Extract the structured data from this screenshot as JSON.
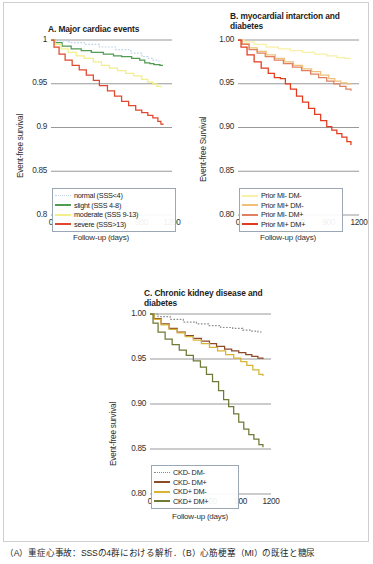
{
  "figure": {
    "caption": "（A）重症心事故：SSSの4群における解析．（B）心筋梗塞（MI）の既往と糖尿"
  },
  "shared": {
    "xlabel": "Follow-up (days)",
    "ylabel": "Event-free survival",
    "xticks": [
      "0",
      "300",
      "600",
      "900",
      "1200"
    ],
    "xlim": [
      0,
      1200
    ]
  },
  "colors": {
    "normal": "#bcd3e8",
    "slight": "#4f9c52",
    "moderate": "#f2ee8a",
    "severe": "#e0472c",
    "mi_neg_dm_neg": "#f7f0a8",
    "mi_pos_dm_neg": "#f0c07a",
    "mi_neg_dm_pos": "#e08060",
    "mi_pos_dm_pos": "#e33a1c",
    "ckd_neg_dm_neg": "#8a8a8a",
    "ckd_neg_dm_pos": "#8c4a2b",
    "ckd_pos_dm_neg": "#d8b434",
    "ckd_pos_dm_pos": "#6e7a35",
    "gridline": "#8d8d8d",
    "legend_border": "#9aa7b5"
  },
  "chart_data": [
    {
      "id": "panel-a",
      "type": "line",
      "title": "A. Major cardiac events",
      "xlabel": "Follow-up (days)",
      "ylabel": "Event-free survival",
      "xlim": [
        0,
        1200
      ],
      "ylim": [
        0.8,
        1.0
      ],
      "xticks": [
        "0",
        "300",
        "600",
        "900",
        "1200"
      ],
      "yticks": [
        "1",
        "0.95",
        "0.9",
        "0.85",
        "0.8"
      ],
      "ytick_values": [
        1.0,
        0.95,
        0.9,
        0.85,
        0.8
      ],
      "grid": "horizontal",
      "legend_position": "bottom-left",
      "series": [
        {
          "name": "normal  (SSS<4)",
          "key": "normal",
          "style": "dotted",
          "color": "#bcd3e8",
          "x": [
            0,
            60,
            180,
            330,
            480,
            640,
            790,
            900,
            960,
            1010,
            1060,
            1100
          ],
          "y": [
            1.0,
            0.999,
            0.997,
            0.995,
            0.992,
            0.989,
            0.985,
            0.981,
            0.979,
            0.977,
            0.976,
            0.976
          ]
        },
        {
          "name": "slight  (SSS 4-8)",
          "key": "slight",
          "style": "solid",
          "color": "#4f9c52",
          "x": [
            0,
            40,
            110,
            200,
            300,
            400,
            520,
            620,
            700,
            800,
            880,
            930,
            980,
            1020,
            1080,
            1110
          ],
          "y": [
            1.0,
            0.997,
            0.993,
            0.99,
            0.988,
            0.986,
            0.984,
            0.982,
            0.981,
            0.979,
            0.977,
            0.974,
            0.973,
            0.972,
            0.971,
            0.971
          ]
        },
        {
          "name": "moderate  (SSS 9-13)",
          "key": "moderate",
          "style": "solid",
          "color": "#f2ee8a",
          "x": [
            0,
            40,
            100,
            170,
            250,
            330,
            420,
            500,
            580,
            660,
            740,
            820,
            900,
            960,
            1010,
            1050,
            1090
          ],
          "y": [
            1.0,
            0.995,
            0.99,
            0.986,
            0.982,
            0.979,
            0.975,
            0.971,
            0.968,
            0.965,
            0.962,
            0.959,
            0.955,
            0.952,
            0.95,
            0.947,
            0.946
          ]
        },
        {
          "name": "severe  (SSS>13)",
          "key": "severe",
          "style": "solid",
          "color": "#e0472c",
          "x": [
            0,
            30,
            80,
            140,
            210,
            280,
            350,
            420,
            480,
            560,
            630,
            700,
            770,
            840,
            900,
            960,
            1010,
            1060,
            1090,
            1110
          ],
          "y": [
            1.0,
            0.992,
            0.984,
            0.977,
            0.971,
            0.966,
            0.96,
            0.954,
            0.948,
            0.942,
            0.936,
            0.93,
            0.925,
            0.92,
            0.917,
            0.914,
            0.911,
            0.907,
            0.904,
            0.903
          ]
        }
      ]
    },
    {
      "id": "panel-b",
      "type": "line",
      "title": "B. myocardial intarction and diabetes",
      "xlabel": "Follow-up (days)",
      "ylabel": "Event-free Survival",
      "xlim": [
        0,
        1200
      ],
      "ylim": [
        0.8,
        1.0
      ],
      "xticks": [
        "0",
        "300",
        "600",
        "900",
        "1200"
      ],
      "yticks": [
        "1.00",
        "0.95",
        "0.90",
        "0.85",
        "0.80"
      ],
      "ytick_values": [
        1.0,
        0.95,
        0.9,
        0.85,
        0.8
      ],
      "grid": "horizontal",
      "legend_position": "bottom-left",
      "series": [
        {
          "name": "Prior MI- DM-",
          "key": "mi_neg_dm_neg",
          "style": "solid",
          "color": "#f7f0a8",
          "x": [
            0,
            60,
            160,
            280,
            400,
            520,
            640,
            760,
            880,
            980,
            1060,
            1120
          ],
          "y": [
            1.0,
            0.998,
            0.995,
            0.992,
            0.99,
            0.988,
            0.986,
            0.984,
            0.982,
            0.98,
            0.979,
            0.979
          ]
        },
        {
          "name": "Prior MI+ DM-",
          "key": "mi_pos_dm_neg",
          "style": "solid",
          "color": "#f0c07a",
          "x": [
            0,
            40,
            110,
            190,
            280,
            370,
            460,
            550,
            640,
            730,
            820,
            900,
            960,
            1020,
            1080,
            1120
          ],
          "y": [
            1.0,
            0.996,
            0.991,
            0.987,
            0.983,
            0.979,
            0.975,
            0.971,
            0.967,
            0.964,
            0.96,
            0.956,
            0.953,
            0.951,
            0.95,
            0.95
          ]
        },
        {
          "name": "Prior MI- DM+",
          "key": "mi_neg_dm_pos",
          "style": "solid",
          "color": "#e08060",
          "x": [
            0,
            40,
            110,
            190,
            270,
            360,
            450,
            540,
            630,
            720,
            800,
            880,
            950,
            1010,
            1070,
            1120
          ],
          "y": [
            1.0,
            0.995,
            0.989,
            0.985,
            0.981,
            0.977,
            0.973,
            0.969,
            0.965,
            0.961,
            0.957,
            0.953,
            0.95,
            0.947,
            0.944,
            0.942
          ]
        },
        {
          "name": "Prior MI+ DM+",
          "key": "mi_pos_dm_pos",
          "style": "solid",
          "color": "#e33a1c",
          "x": [
            0,
            30,
            90,
            160,
            230,
            300,
            360,
            420,
            470,
            520,
            580,
            640,
            700,
            760,
            820,
            880,
            930,
            980,
            1030,
            1080,
            1120
          ],
          "y": [
            1.0,
            0.992,
            0.983,
            0.975,
            0.968,
            0.962,
            0.957,
            0.956,
            0.95,
            0.944,
            0.936,
            0.929,
            0.922,
            0.915,
            0.908,
            0.901,
            0.897,
            0.893,
            0.889,
            0.884,
            0.88
          ]
        }
      ]
    },
    {
      "id": "panel-c",
      "type": "line",
      "title": "C. Chronic kidney disease and diabetes",
      "xlabel": "Follow-up (days)",
      "ylabel": "Event-free survival",
      "xlim": [
        0,
        1200
      ],
      "ylim": [
        0.8,
        1.0
      ],
      "xticks": [
        "0",
        "300",
        "600",
        "900",
        "1200"
      ],
      "yticks": [
        "1.00",
        "0.95",
        "0.90",
        "0.85",
        "0.80"
      ],
      "ytick_values": [
        1.0,
        0.95,
        0.9,
        0.85,
        0.8
      ],
      "grid": "horizontal",
      "legend_position": "bottom-left",
      "series": [
        {
          "name": "CKD- DM-",
          "key": "ckd_neg_dm_neg",
          "style": "dotted",
          "color": "#8a8a8a",
          "x": [
            0,
            80,
            200,
            330,
            460,
            580,
            700,
            820,
            920,
            1000,
            1070,
            1120
          ],
          "y": [
            1.0,
            0.997,
            0.994,
            0.991,
            0.989,
            0.987,
            0.985,
            0.984,
            0.982,
            0.981,
            0.98,
            0.98
          ]
        },
        {
          "name": "CKD- DM+",
          "key": "ckd_neg_dm_pos",
          "style": "solid",
          "color": "#8c4a2b",
          "x": [
            0,
            40,
            110,
            190,
            270,
            350,
            430,
            510,
            590,
            660,
            740,
            810,
            880,
            950,
            1010,
            1070,
            1120
          ],
          "y": [
            1.0,
            0.995,
            0.989,
            0.984,
            0.98,
            0.976,
            0.973,
            0.97,
            0.967,
            0.964,
            0.961,
            0.959,
            0.957,
            0.955,
            0.953,
            0.951,
            0.95
          ]
        },
        {
          "name": "CKD+ DM-",
          "key": "ckd_pos_dm_neg",
          "style": "solid",
          "color": "#d8b434",
          "x": [
            0,
            40,
            110,
            190,
            270,
            350,
            430,
            510,
            590,
            670,
            750,
            830,
            900,
            960,
            1020,
            1080,
            1120
          ],
          "y": [
            1.0,
            0.994,
            0.988,
            0.983,
            0.979,
            0.975,
            0.971,
            0.967,
            0.963,
            0.959,
            0.955,
            0.951,
            0.947,
            0.943,
            0.938,
            0.933,
            0.931
          ]
        },
        {
          "name": "CKD+ DM+",
          "key": "ckd_pos_dm_pos",
          "style": "solid",
          "color": "#6e7a35",
          "x": [
            0,
            30,
            80,
            150,
            220,
            290,
            360,
            430,
            500,
            560,
            620,
            680,
            730,
            780,
            830,
            880,
            930,
            980,
            1030,
            1080,
            1120
          ],
          "y": [
            1.0,
            0.99,
            0.98,
            0.972,
            0.966,
            0.96,
            0.954,
            0.948,
            0.941,
            0.933,
            0.925,
            0.915,
            0.905,
            0.897,
            0.889,
            0.88,
            0.872,
            0.866,
            0.861,
            0.855,
            0.852
          ]
        }
      ]
    }
  ]
}
